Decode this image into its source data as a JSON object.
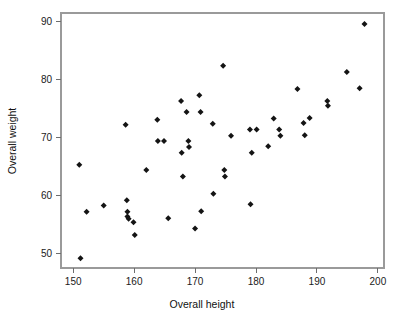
{
  "figure": {
    "background_color": "#ffffff",
    "frame_color": "#9a9a9a",
    "marker_color": "#141414",
    "marker_shape": "diamond"
  },
  "chart_data": {
    "type": "scatter",
    "title": "",
    "xlabel": "Overall height",
    "ylabel": "Overall weight",
    "xlim": [
      148,
      201
    ],
    "ylim": [
      47.5,
      91.5
    ],
    "xticks": [
      150,
      160,
      170,
      180,
      190,
      200
    ],
    "yticks": [
      50,
      60,
      70,
      80,
      90
    ],
    "xtick_labels": [
      "150",
      "160",
      "170",
      "180",
      "190",
      "200"
    ],
    "ytick_labels": [
      "50",
      "60",
      "70",
      "80",
      "90"
    ],
    "grid": false,
    "legend": null,
    "series": [
      {
        "name": "observations",
        "marker": "diamond",
        "color": "#141414",
        "points": [
          [
            151.0,
            65.3
          ],
          [
            151.2,
            49.2
          ],
          [
            152.2,
            57.2
          ],
          [
            155.0,
            58.3
          ],
          [
            158.6,
            72.2
          ],
          [
            158.8,
            59.2
          ],
          [
            158.9,
            57.2
          ],
          [
            158.9,
            56.4
          ],
          [
            159.1,
            56.0
          ],
          [
            159.9,
            55.4
          ],
          [
            160.1,
            53.2
          ],
          [
            162.0,
            64.4
          ],
          [
            163.8,
            73.1
          ],
          [
            163.9,
            69.4
          ],
          [
            164.9,
            69.4
          ],
          [
            165.6,
            56.1
          ],
          [
            167.7,
            76.3
          ],
          [
            167.8,
            67.4
          ],
          [
            168.0,
            63.3
          ],
          [
            168.6,
            74.4
          ],
          [
            168.9,
            69.4
          ],
          [
            169.0,
            68.4
          ],
          [
            170.0,
            54.3
          ],
          [
            170.7,
            77.3
          ],
          [
            170.9,
            74.4
          ],
          [
            171.0,
            57.3
          ],
          [
            172.9,
            72.4
          ],
          [
            173.0,
            60.3
          ],
          [
            174.6,
            82.4
          ],
          [
            174.8,
            64.4
          ],
          [
            174.9,
            63.3
          ],
          [
            175.9,
            70.3
          ],
          [
            179.0,
            71.4
          ],
          [
            179.1,
            58.5
          ],
          [
            179.3,
            67.4
          ],
          [
            180.1,
            71.4
          ],
          [
            182.0,
            68.5
          ],
          [
            182.9,
            73.3
          ],
          [
            183.8,
            71.4
          ],
          [
            184.0,
            70.3
          ],
          [
            186.8,
            78.4
          ],
          [
            187.8,
            72.5
          ],
          [
            188.0,
            70.4
          ],
          [
            188.8,
            73.4
          ],
          [
            191.7,
            76.3
          ],
          [
            191.8,
            75.5
          ],
          [
            194.9,
            81.3
          ],
          [
            197.0,
            78.5
          ],
          [
            197.8,
            89.6
          ]
        ]
      }
    ]
  }
}
